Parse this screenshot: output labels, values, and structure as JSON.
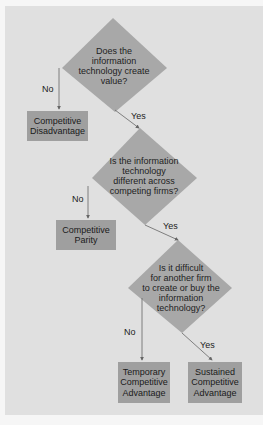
{
  "colors": {
    "background": "#f6f6f6",
    "panel": "#e0e0e0",
    "decision_fill": "#a8a8a8",
    "outcome_fill": "#9f9f9f",
    "arrow": "#666666"
  },
  "decisions": [
    {
      "id": "d1",
      "lines": [
        "Does the",
        "information",
        "technology create",
        "value?"
      ]
    },
    {
      "id": "d2",
      "lines": [
        "Is the information",
        "technology",
        "different across",
        "competing firms?"
      ]
    },
    {
      "id": "d3",
      "lines": [
        "Is it difficult",
        "for another firm",
        "to create or buy the",
        "information",
        "technology?"
      ]
    }
  ],
  "outcomes": [
    {
      "id": "o1",
      "lines": [
        "Competitive",
        "Disadvantage"
      ]
    },
    {
      "id": "o2",
      "lines": [
        "Competitive",
        "Parity"
      ]
    },
    {
      "id": "o3",
      "lines": [
        "Temporary",
        "Competitive",
        "Advantage"
      ]
    },
    {
      "id": "o4",
      "lines": [
        "Sustained",
        "Competitive",
        "Advantage"
      ]
    }
  ],
  "branches": {
    "d1_no": "No",
    "d1_yes": "Yes",
    "d2_no": "No",
    "d2_yes": "Yes",
    "d3_no": "No",
    "d3_yes": "Yes"
  }
}
